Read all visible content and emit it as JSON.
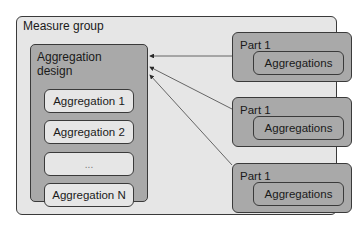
{
  "diagram": {
    "measure_group": {
      "title": "Measure group"
    },
    "aggregation_design": {
      "title": "Aggregation design",
      "title_lines": [
        "Aggregation",
        "design"
      ],
      "items": [
        "Aggregation 1",
        "Aggregation 2",
        "...",
        "Aggregation N"
      ]
    },
    "parts": [
      {
        "label": "Part 1",
        "inner": "Aggregations"
      },
      {
        "label": "Part 1",
        "inner": "Aggregations"
      },
      {
        "label": "Part 1",
        "inner": "Aggregations"
      }
    ],
    "edges": [
      {
        "from": "parts.0",
        "to": "aggregation_design"
      },
      {
        "from": "parts.1",
        "to": "aggregation_design"
      },
      {
        "from": "parts.2",
        "to": "aggregation_design"
      }
    ],
    "colors": {
      "outer_fill": "#e6e6e6",
      "design_fill": "#a9a9a9",
      "stroke": "#3a3a3a"
    }
  }
}
